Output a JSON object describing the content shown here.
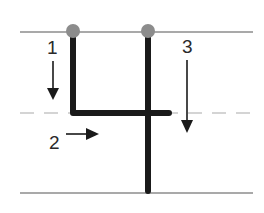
{
  "diagram": {
    "steps": [
      {
        "number": "1",
        "direction": "down"
      },
      {
        "number": "2",
        "direction": "right"
      },
      {
        "number": "3",
        "direction": "down"
      }
    ],
    "colors": {
      "stroke": "#1a1a1a",
      "start_dot": "#8c8c8c",
      "guide_line": "#555555",
      "dashed_line": "#aaaaaa"
    }
  }
}
